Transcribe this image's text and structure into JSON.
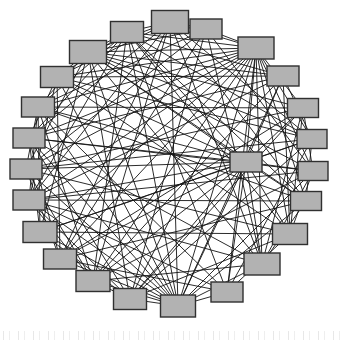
{
  "figure": {
    "kind": "network-graph",
    "layout": "circular",
    "background_color": "#ffffff",
    "width": 340,
    "height": 341,
    "bottom_artifact": {
      "present": true,
      "description": "faint scan noise strip",
      "legible_text": ""
    }
  },
  "chart_data": {
    "type": "graph",
    "title": "",
    "subtitle": "",
    "xlabel": "",
    "ylabel": "",
    "grid": false,
    "legend": "none",
    "layout": "circular",
    "node_count": 24,
    "edge_count": 146,
    "node_style": {
      "shape": "rectangle",
      "fill": "#b2b2b2",
      "stroke": "#303030",
      "stroke_width": 1.4,
      "default_width": 32,
      "default_height": 20
    },
    "edge_style": {
      "stroke": "#141414",
      "stroke_width": 0.9,
      "curved": false
    },
    "center": {
      "x": 170,
      "y": 166
    },
    "radius": 138,
    "nodes": [
      {
        "id": 0,
        "label": "n0",
        "x": 170,
        "y": 22,
        "w": 37,
        "h": 23
      },
      {
        "id": 1,
        "label": "n1",
        "x": 206,
        "y": 29,
        "w": 32,
        "h": 20
      },
      {
        "id": 2,
        "label": "n2",
        "x": 256,
        "y": 48,
        "w": 36,
        "h": 22
      },
      {
        "id": 3,
        "label": "n3",
        "x": 283,
        "y": 76,
        "w": 32,
        "h": 20
      },
      {
        "id": 4,
        "label": "n4",
        "x": 303,
        "y": 108,
        "w": 31,
        "h": 19
      },
      {
        "id": 5,
        "label": "n5",
        "x": 312,
        "y": 139,
        "w": 30,
        "h": 19
      },
      {
        "id": 6,
        "label": "n6",
        "x": 313,
        "y": 171,
        "w": 30,
        "h": 19
      },
      {
        "id": 7,
        "label": "n7",
        "x": 306,
        "y": 201,
        "w": 31,
        "h": 19
      },
      {
        "id": 8,
        "label": "n8",
        "x": 290,
        "y": 234,
        "w": 35,
        "h": 21
      },
      {
        "id": 9,
        "label": "n9",
        "x": 262,
        "y": 264,
        "w": 36,
        "h": 22
      },
      {
        "id": 10,
        "label": "n10",
        "x": 227,
        "y": 292,
        "w": 32,
        "h": 20
      },
      {
        "id": 11,
        "label": "n11",
        "x": 178,
        "y": 306,
        "w": 35,
        "h": 22
      },
      {
        "id": 12,
        "label": "n12",
        "x": 130,
        "y": 299,
        "w": 33,
        "h": 21
      },
      {
        "id": 13,
        "label": "n13",
        "x": 93,
        "y": 281,
        "w": 34,
        "h": 21
      },
      {
        "id": 14,
        "label": "n14",
        "x": 60,
        "y": 259,
        "w": 33,
        "h": 20
      },
      {
        "id": 15,
        "label": "n15",
        "x": 40,
        "y": 232,
        "w": 34,
        "h": 21
      },
      {
        "id": 16,
        "label": "n16",
        "x": 29,
        "y": 200,
        "w": 32,
        "h": 20
      },
      {
        "id": 17,
        "label": "n17",
        "x": 26,
        "y": 169,
        "w": 32,
        "h": 20
      },
      {
        "id": 18,
        "label": "n18",
        "x": 29,
        "y": 138,
        "w": 32,
        "h": 20
      },
      {
        "id": 19,
        "label": "n19",
        "x": 38,
        "y": 107,
        "w": 33,
        "h": 20
      },
      {
        "id": 20,
        "label": "n20",
        "x": 57,
        "y": 77,
        "w": 33,
        "h": 21
      },
      {
        "id": 21,
        "label": "n21",
        "x": 88,
        "y": 52,
        "w": 37,
        "h": 23
      },
      {
        "id": 22,
        "label": "n22",
        "x": 127,
        "y": 32,
        "w": 33,
        "h": 21
      },
      {
        "id": 23,
        "label": "n23",
        "x": 246,
        "y": 162,
        "w": 32,
        "h": 20
      }
    ],
    "edges": [
      [
        0,
        5
      ],
      [
        0,
        7
      ],
      [
        0,
        9
      ],
      [
        0,
        11
      ],
      [
        0,
        13
      ],
      [
        0,
        14
      ],
      [
        0,
        16
      ],
      [
        0,
        18
      ],
      [
        0,
        20
      ],
      [
        0,
        21
      ],
      [
        1,
        6
      ],
      [
        1,
        9
      ],
      [
        1,
        12
      ],
      [
        1,
        14
      ],
      [
        1,
        17
      ],
      [
        1,
        19
      ],
      [
        1,
        21
      ],
      [
        2,
        5
      ],
      [
        2,
        7
      ],
      [
        2,
        9
      ],
      [
        2,
        10
      ],
      [
        2,
        11
      ],
      [
        2,
        12
      ],
      [
        2,
        13
      ],
      [
        2,
        14
      ],
      [
        2,
        15
      ],
      [
        2,
        16
      ],
      [
        2,
        17
      ],
      [
        2,
        18
      ],
      [
        2,
        19
      ],
      [
        2,
        20
      ],
      [
        2,
        21
      ],
      [
        2,
        23
      ],
      [
        3,
        8
      ],
      [
        3,
        11
      ],
      [
        3,
        13
      ],
      [
        3,
        16
      ],
      [
        3,
        18
      ],
      [
        3,
        20
      ],
      [
        3,
        22
      ],
      [
        4,
        9
      ],
      [
        4,
        12
      ],
      [
        4,
        14
      ],
      [
        4,
        17
      ],
      [
        4,
        19
      ],
      [
        4,
        21
      ],
      [
        4,
        23
      ],
      [
        5,
        10
      ],
      [
        5,
        12
      ],
      [
        5,
        15
      ],
      [
        5,
        17
      ],
      [
        5,
        20
      ],
      [
        5,
        22
      ],
      [
        6,
        11
      ],
      [
        6,
        13
      ],
      [
        6,
        16
      ],
      [
        6,
        18
      ],
      [
        6,
        21
      ],
      [
        6,
        23
      ],
      [
        7,
        11
      ],
      [
        7,
        14
      ],
      [
        7,
        16
      ],
      [
        7,
        19
      ],
      [
        7,
        22
      ],
      [
        8,
        12
      ],
      [
        8,
        15
      ],
      [
        8,
        17
      ],
      [
        8,
        20
      ],
      [
        8,
        22
      ],
      [
        8,
        23
      ],
      [
        9,
        13
      ],
      [
        9,
        16
      ],
      [
        9,
        18
      ],
      [
        9,
        21
      ],
      [
        9,
        23
      ],
      [
        10,
        14
      ],
      [
        10,
        16
      ],
      [
        10,
        19
      ],
      [
        10,
        22
      ],
      [
        10,
        23
      ],
      [
        11,
        14
      ],
      [
        11,
        15
      ],
      [
        11,
        16
      ],
      [
        11,
        17
      ],
      [
        11,
        18
      ],
      [
        11,
        19
      ],
      [
        11,
        20
      ],
      [
        11,
        21
      ],
      [
        11,
        22
      ],
      [
        11,
        23
      ],
      [
        12,
        16
      ],
      [
        12,
        18
      ],
      [
        12,
        21
      ],
      [
        12,
        23
      ],
      [
        13,
        17
      ],
      [
        13,
        19
      ],
      [
        13,
        22
      ],
      [
        13,
        23
      ],
      [
        14,
        18
      ],
      [
        14,
        20
      ],
      [
        14,
        23
      ],
      [
        15,
        19
      ],
      [
        15,
        21
      ],
      [
        15,
        23
      ],
      [
        16,
        20
      ],
      [
        16,
        22
      ],
      [
        16,
        23
      ],
      [
        17,
        21
      ],
      [
        17,
        23
      ],
      [
        18,
        22
      ],
      [
        18,
        23
      ],
      [
        19,
        23
      ],
      [
        20,
        23
      ],
      [
        21,
        23
      ],
      [
        22,
        23
      ],
      [
        0,
        2
      ],
      [
        0,
        22
      ],
      [
        2,
        22
      ],
      [
        1,
        2
      ],
      [
        0,
        1
      ],
      [
        21,
        22
      ],
      [
        20,
        21
      ],
      [
        11,
        12
      ],
      [
        11,
        10
      ],
      [
        10,
        11
      ],
      [
        12,
        13
      ],
      [
        3,
        23
      ],
      [
        4,
        8
      ],
      [
        5,
        23
      ],
      [
        6,
        9
      ],
      [
        7,
        23
      ],
      [
        2,
        6
      ],
      [
        2,
        4
      ],
      [
        2,
        8
      ],
      [
        21,
        3
      ],
      [
        21,
        5
      ],
      [
        21,
        7
      ],
      [
        11,
        2
      ],
      [
        11,
        21
      ],
      [
        11,
        13
      ],
      [
        11,
        9
      ],
      [
        23,
        9
      ],
      [
        23,
        10
      ],
      [
        23,
        11
      ],
      [
        23,
        12
      ],
      [
        19,
        22
      ],
      [
        16,
        19
      ],
      [
        15,
        18
      ],
      [
        14,
        17
      ],
      [
        13,
        16
      ],
      [
        12,
        15
      ],
      [
        3,
        5
      ],
      [
        4,
        6
      ],
      [
        5,
        7
      ],
      [
        6,
        8
      ],
      [
        7,
        9
      ],
      [
        8,
        10
      ],
      [
        9,
        11
      ],
      [
        17,
        19
      ],
      [
        18,
        20
      ],
      [
        19,
        21
      ],
      [
        20,
        22
      ]
    ]
  }
}
